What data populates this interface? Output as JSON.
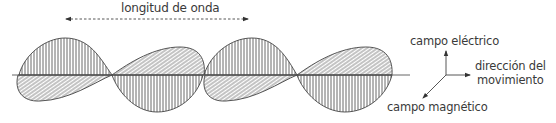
{
  "labels": {
    "wavelength": "longitud de onda",
    "electric_field": "campo eléctrico",
    "direction_line1": "dirección del",
    "direction_line2": "movimiento",
    "magnetic_field": "campo magnético"
  },
  "colors": {
    "ink": "#3a3a3a",
    "background": "#ffffff"
  },
  "wave": {
    "axis_y": 75,
    "electric_lobes": [
      {
        "x0": 18,
        "x1": 112,
        "direction": "up"
      },
      {
        "x0": 112,
        "x1": 203,
        "direction": "down"
      },
      {
        "x0": 203,
        "x1": 297,
        "direction": "up"
      },
      {
        "x0": 297,
        "x1": 393,
        "direction": "down"
      }
    ],
    "magnetic_lobes": [
      {
        "x0": 16,
        "x1": 112,
        "direction": "down"
      },
      {
        "x0": 112,
        "x1": 204,
        "direction": "up"
      },
      {
        "x0": 204,
        "x1": 297,
        "direction": "down"
      },
      {
        "x0": 297,
        "x1": 393,
        "direction": "up"
      }
    ]
  }
}
